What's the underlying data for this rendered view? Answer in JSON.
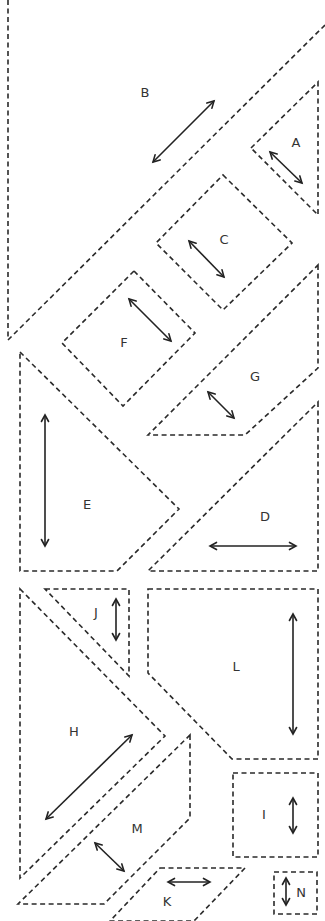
{
  "diagram": {
    "stroke_color": "#2a2a2a",
    "pieces": [
      {
        "id": "B",
        "label": "B",
        "points": [
          [
            8,
            0
          ],
          [
            8,
            340
          ],
          [
            325,
            25
          ]
        ],
        "open": true,
        "label_pos": [
          145,
          93
        ],
        "grain": [
          [
            153,
            162
          ],
          [
            214,
            101
          ]
        ]
      },
      {
        "id": "A",
        "label": "A",
        "points": [
          [
            251,
            148
          ],
          [
            318,
            82
          ],
          [
            318,
            215
          ]
        ],
        "label_pos": [
          296,
          143
        ],
        "grain": [
          [
            270,
            152
          ],
          [
            302,
            183
          ]
        ]
      },
      {
        "id": "C",
        "label": "C",
        "points": [
          [
            223,
            175
          ],
          [
            292,
            243
          ],
          [
            223,
            310
          ],
          [
            156,
            243
          ]
        ],
        "label_pos": [
          224,
          240
        ],
        "grain": [
          [
            189,
            241
          ],
          [
            224,
            277
          ]
        ]
      },
      {
        "id": "F",
        "label": "F",
        "points": [
          [
            134,
            271
          ],
          [
            195,
            333
          ],
          [
            123,
            406
          ],
          [
            62,
            343
          ]
        ],
        "label_pos": [
          124,
          343
        ],
        "grain": [
          [
            129,
            299
          ],
          [
            171,
            341
          ]
        ]
      },
      {
        "id": "G",
        "label": "G",
        "points": [
          [
            318,
            265
          ],
          [
            318,
            368
          ],
          [
            245,
            435
          ],
          [
            148,
            435
          ]
        ],
        "label_pos": [
          255,
          377
        ],
        "grain": [
          [
            208,
            392
          ],
          [
            234,
            418
          ]
        ]
      },
      {
        "id": "E",
        "label": "E",
        "points": [
          [
            20,
            352
          ],
          [
            179,
            509
          ],
          [
            117,
            571
          ],
          [
            20,
            571
          ]
        ],
        "label_pos": [
          87,
          505
        ],
        "grain": [
          [
            45,
            415
          ],
          [
            45,
            546
          ]
        ]
      },
      {
        "id": "D",
        "label": "D",
        "points": [
          [
            318,
            402
          ],
          [
            318,
            571
          ],
          [
            148,
            571
          ]
        ],
        "label_pos": [
          265,
          517
        ],
        "grain": [
          [
            210,
            546
          ],
          [
            296,
            546
          ]
        ]
      },
      {
        "id": "J",
        "label": "J",
        "points": [
          [
            45,
            589
          ],
          [
            129,
            589
          ],
          [
            129,
            676
          ]
        ],
        "label_pos": [
          96,
          613
        ],
        "grain": [
          [
            116,
            599
          ],
          [
            116,
            640
          ]
        ]
      },
      {
        "id": "L",
        "label": "L",
        "points": [
          [
            148,
            589
          ],
          [
            318,
            589
          ],
          [
            318,
            759
          ],
          [
            232,
            759
          ],
          [
            148,
            673
          ]
        ],
        "label_pos": [
          236,
          667
        ],
        "grain": [
          [
            293,
            614
          ],
          [
            293,
            734
          ]
        ]
      },
      {
        "id": "H",
        "label": "H",
        "points": [
          [
            20,
            589
          ],
          [
            165,
            736
          ],
          [
            20,
            878
          ]
        ],
        "label_pos": [
          74,
          732
        ],
        "grain": [
          [
            46,
            819
          ],
          [
            132,
            735
          ]
        ]
      },
      {
        "id": "M",
        "label": "M",
        "points": [
          [
            190,
            735
          ],
          [
            190,
            818
          ],
          [
            104,
            904
          ],
          [
            18,
            904
          ]
        ],
        "label_pos": [
          137,
          829
        ],
        "grain": [
          [
            95,
            843
          ],
          [
            124,
            871
          ]
        ]
      },
      {
        "id": "I",
        "label": "I",
        "points": [
          [
            233,
            773
          ],
          [
            318,
            773
          ],
          [
            318,
            857
          ],
          [
            233,
            857
          ]
        ],
        "label_pos": [
          264,
          815
        ],
        "grain": [
          [
            293,
            798
          ],
          [
            293,
            833
          ]
        ]
      },
      {
        "id": "K",
        "label": "K",
        "points": [
          [
            160,
            868
          ],
          [
            245,
            868
          ],
          [
            194,
            921
          ],
          [
            110,
            921
          ]
        ],
        "label_pos": [
          167,
          902
        ],
        "grain": [
          [
            168,
            882
          ],
          [
            210,
            882
          ]
        ]
      },
      {
        "id": "N",
        "label": "N",
        "points": [
          [
            274,
            872
          ],
          [
            317,
            872
          ],
          [
            317,
            914
          ],
          [
            274,
            914
          ]
        ],
        "label_pos": [
          301,
          893
        ],
        "grain": [
          [
            286,
            878
          ],
          [
            286,
            905
          ]
        ]
      }
    ]
  }
}
